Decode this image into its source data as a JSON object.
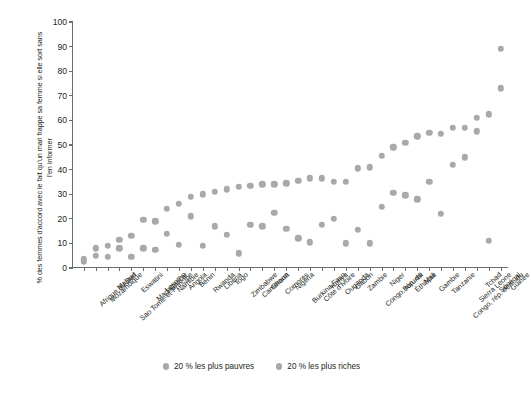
{
  "chart_data": {
    "type": "scatter",
    "title": "",
    "xlabel": "",
    "ylabel": "% des femmes d'accord avec le fait qu'un mari frappe sa femme si elle sort sans l'en informer",
    "ylim": [
      0,
      100
    ],
    "ytick_labels": [
      "0",
      "10",
      "20",
      "30",
      "40",
      "50",
      "60",
      "70",
      "80",
      "90",
      "100"
    ],
    "ytick_values": [
      0,
      10,
      20,
      30,
      40,
      50,
      60,
      70,
      80,
      90,
      100
    ],
    "grid": false,
    "legend_position": "bottom",
    "categories": [
      "Afrique du Sud",
      "Mozambique",
      "Malawi",
      "Sao Tomé-et-Principe",
      "Eswatini",
      "Madagascar",
      "Lesotho",
      "Namibie",
      "Angola",
      "Bénin",
      "Rwanda",
      "Libéria",
      "Togo",
      "Zimbabwe",
      "Cameroun",
      "Ghana",
      "Comores",
      "Nigéria",
      "Burkina Faso",
      "Côte d'Ivoire",
      "Kenya",
      "Ouganda",
      "Gabon",
      "Zambie",
      "Congo, rép. du",
      "Niger",
      "Burundi",
      "Éthiopie",
      "Mali",
      "Gambie",
      "Tanzanie",
      "Congo, rép. dém. du",
      "Sierra Leone",
      "Tchad",
      "Sénégal",
      "Guinée"
    ],
    "series": [
      {
        "name": "20 % les plus pauvres",
        "color": "#a7a9ac",
        "values": [
          3.5,
          8,
          9,
          11.5,
          13,
          19.5,
          19,
          24,
          26,
          29,
          30,
          31,
          32,
          33,
          33.5,
          34,
          34,
          34.5,
          35.5,
          36.5,
          36.5,
          35,
          35,
          40.5,
          41,
          45.5,
          49,
          51,
          53.5,
          55,
          54.5,
          57,
          57,
          61,
          62.5,
          89
        ]
      },
      {
        "name": "20 % les plus riches",
        "color": "#a7a9ac",
        "values": [
          2.5,
          5,
          4.5,
          8,
          4.5,
          8,
          7.5,
          14,
          9.5,
          21,
          9,
          17,
          13.5,
          6,
          17.5,
          17,
          22.5,
          16,
          12,
          10.5,
          17.5,
          20,
          10,
          15.5,
          10,
          25,
          30.5,
          29.5,
          28,
          35,
          22,
          42,
          45,
          55.5,
          11,
          73
        ]
      }
    ]
  },
  "legend": {
    "items": [
      {
        "label": "20 % les plus pauvres"
      },
      {
        "label": "20 % les plus riches"
      }
    ]
  },
  "colors": {
    "marker": "#a7a9ac",
    "axis": "#6d6e71",
    "text": "#231f20",
    "background": "#ffffff"
  }
}
